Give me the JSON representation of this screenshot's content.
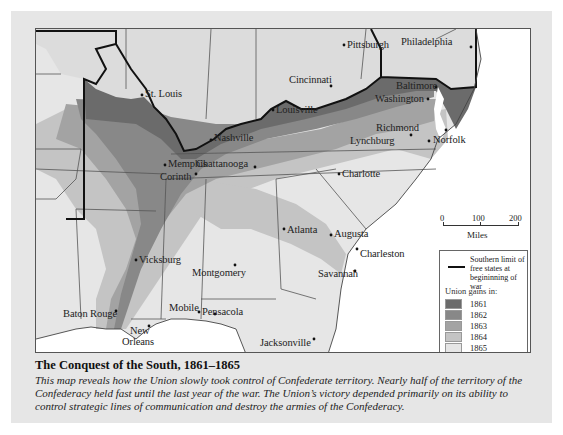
{
  "figure": {
    "title": "The Conquest of the South, 1861–1865",
    "caption": "This map reveals how the Union slowly took control of Confederate territory. Nearly half of the territory of the Confederacy held fast until the last year of the war. The Union’s victory depended primarily on its ability to control strategic lines of communication and destroy the armies of the Confederacy."
  },
  "map": {
    "cities": [
      {
        "name": "Pittsburgh",
        "x": 311,
        "y": 13
      },
      {
        "name": "Philadelphia",
        "x": 365,
        "y": 14
      },
      {
        "name": "St. Louis",
        "x": 109,
        "y": 62
      },
      {
        "name": "Cincinnati",
        "x": 253,
        "y": 52
      },
      {
        "name": "Baltimore",
        "x": 362,
        "y": 53
      },
      {
        "name": "Washington",
        "x": 347,
        "y": 66
      },
      {
        "name": "Louisville",
        "x": 240,
        "y": 77
      },
      {
        "name": "Richmond",
        "x": 368,
        "y": 97
      },
      {
        "name": "Norfolk",
        "x": 396,
        "y": 107
      },
      {
        "name": "Lynchburg",
        "x": 334,
        "y": 107
      },
      {
        "name": "Nashville",
        "x": 178,
        "y": 107
      },
      {
        "name": "Memphis",
        "x": 132,
        "y": 132
      },
      {
        "name": "Chattanooga",
        "x": 174,
        "y": 134
      },
      {
        "name": "Corinth",
        "x": 134,
        "y": 144
      },
      {
        "name": "Charlotte",
        "x": 306,
        "y": 141
      },
      {
        "name": "Atlanta",
        "x": 251,
        "y": 197
      },
      {
        "name": "Augusta",
        "x": 297,
        "y": 199
      },
      {
        "name": "Charleston",
        "x": 324,
        "y": 219
      },
      {
        "name": "Vicksburg",
        "x": 103,
        "y": 227
      },
      {
        "name": "Montgomery",
        "x": 169,
        "y": 236
      },
      {
        "name": "Savannah",
        "x": 284,
        "y": 238
      },
      {
        "name": "Baton Rouge",
        "x": 27,
        "y": 278
      },
      {
        "name": "Mobile",
        "x": 133,
        "y": 277
      },
      {
        "name": "Pensacola",
        "x": 166,
        "y": 277
      },
      {
        "name": "Jacksonville",
        "x": 232,
        "y": 307
      },
      {
        "name": "New",
        "x": 94,
        "y": 294
      },
      {
        "name": "Orleans",
        "x": 86,
        "y": 304
      }
    ]
  },
  "scale": {
    "ticks": [
      "0",
      "100",
      "200"
    ],
    "unit": "Miles"
  },
  "legend": {
    "line_label": "Southern limit of free states at begininning of war",
    "gains_title": "Union gains in:",
    "items": [
      {
        "year": "1861",
        "color": "#6b6b6b"
      },
      {
        "year": "1862",
        "color": "#888888"
      },
      {
        "year": "1863",
        "color": "#a3a3a3"
      },
      {
        "year": "1864",
        "color": "#c4c4c4"
      },
      {
        "year": "1865",
        "color": "#e6e6e6"
      }
    ]
  },
  "colors": {
    "panel": "#e6e6e6",
    "north": "#dcdcdc",
    "water": "#ffffff",
    "border_line": "#111111"
  }
}
